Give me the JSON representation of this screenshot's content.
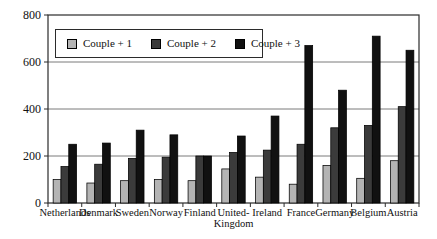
{
  "figure": {
    "background": "#ffffff"
  },
  "chart_data": {
    "type": "bar",
    "categories": [
      "Netherlands",
      "Denmark",
      "Sweden",
      "Norway",
      "Finland",
      "United-\nKingdom",
      "Ireland",
      "France",
      "Germany",
      "Belgium",
      "Austria"
    ],
    "series": [
      {
        "name": "Couple + 1",
        "color": "#b4b4b4",
        "values": [
          100,
          85,
          95,
          100,
          95,
          145,
          110,
          80,
          160,
          105,
          180
        ]
      },
      {
        "name": "Couple + 2",
        "color": "#3b3b3b",
        "values": [
          155,
          165,
          190,
          195,
          200,
          215,
          225,
          250,
          320,
          330,
          410
        ]
      },
      {
        "name": "Couple + 3",
        "color": "#111111",
        "values": [
          250,
          255,
          310,
          290,
          200,
          285,
          370,
          670,
          480,
          710,
          650
        ]
      }
    ],
    "xlabel": "",
    "ylabel": "",
    "ylim": [
      0,
      800
    ],
    "yticks": [
      0,
      200,
      400,
      600,
      800
    ],
    "grid": true,
    "legend_position": "top-left-inside"
  },
  "colors": {
    "gridline": "#7a7a7a",
    "frame": "#2b2b2b",
    "bar_stroke": "#000000",
    "text": "#111111"
  }
}
